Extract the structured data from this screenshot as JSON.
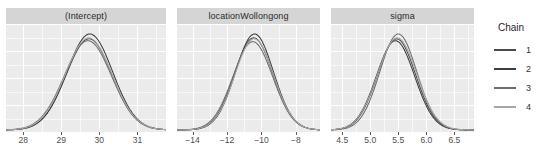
{
  "chart_data": {
    "type": "line",
    "plot_kind": "mcmc-posterior-density-facets",
    "title": "",
    "xlabel": "",
    "ylabel": "",
    "grid": true,
    "legend": {
      "title": "Chain",
      "position": "right",
      "entries": [
        {
          "label": "1",
          "color": "#4a4a4a"
        },
        {
          "label": "2",
          "color": "#3d3d3d"
        },
        {
          "label": "3",
          "color": "#6e6e6e"
        },
        {
          "label": "4",
          "color": "#a8a8a8"
        }
      ]
    },
    "panels": [
      {
        "strip_label": "(Intercept)",
        "xlim": [
          27.55,
          31.75
        ],
        "ticks": [
          28,
          29,
          30,
          31
        ],
        "tick_labels": [
          "28",
          "29",
          "30",
          "31"
        ],
        "minor_ticks": [
          27.5,
          28.5,
          29.5,
          30.5,
          31.5
        ],
        "series": [
          {
            "name": "1",
            "mean": 29.73,
            "sd": 0.6,
            "peak": 0.95
          },
          {
            "name": "2",
            "mean": 29.75,
            "sd": 0.6,
            "peak": 1.0
          },
          {
            "name": "3",
            "mean": 29.7,
            "sd": 0.62,
            "peak": 0.93
          },
          {
            "name": "4",
            "mean": 29.72,
            "sd": 0.61,
            "peak": 0.96
          }
        ]
      },
      {
        "strip_label": "locationWollongong",
        "xlim": [
          -14.9,
          -6.6
        ],
        "ticks": [
          -14,
          -12,
          -10,
          -8
        ],
        "tick_labels": [
          "−14",
          "−12",
          "−10",
          "−8"
        ],
        "minor_ticks": [
          -15,
          -13,
          -11,
          -9,
          -7
        ],
        "series": [
          {
            "name": "1",
            "mean": -10.45,
            "sd": 1.12,
            "peak": 0.96
          },
          {
            "name": "2",
            "mean": -10.4,
            "sd": 1.1,
            "peak": 1.0
          },
          {
            "name": "3",
            "mean": -10.5,
            "sd": 1.15,
            "peak": 0.92
          },
          {
            "name": "4",
            "mean": -10.42,
            "sd": 1.12,
            "peak": 0.95
          }
        ]
      },
      {
        "strip_label": "sigma",
        "xlim": [
          4.3,
          6.85
        ],
        "ticks": [
          4.5,
          5.0,
          5.5,
          6.0,
          6.5
        ],
        "tick_labels": [
          "4.5",
          "5.0",
          "5.5",
          "6.0",
          "6.5"
        ],
        "minor_ticks": [
          4.25,
          4.75,
          5.25,
          5.75,
          6.25,
          6.75
        ],
        "series": [
          {
            "name": "1",
            "mean": 5.47,
            "sd": 0.34,
            "peak": 0.95
          },
          {
            "name": "2",
            "mean": 5.45,
            "sd": 0.34,
            "peak": 0.93
          },
          {
            "name": "3",
            "mean": 5.5,
            "sd": 0.33,
            "peak": 1.0
          },
          {
            "name": "4",
            "mean": 5.48,
            "sd": 0.35,
            "peak": 0.96
          }
        ]
      }
    ]
  },
  "style": {
    "panel_background": "#ebebeb",
    "strip_background": "#d5d5d5",
    "grid_color": "#ffffff",
    "tick_color": "#5b5b5b",
    "text_color": "#4d4d4d"
  }
}
